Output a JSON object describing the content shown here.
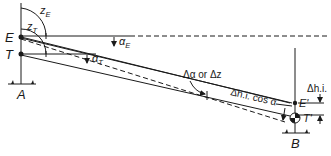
{
  "diagram": {
    "type": "trigonometric leveling geometry",
    "points": {
      "E": "E",
      "T": "T",
      "A": "A",
      "B": "B",
      "E_prime": "E'",
      "T_prime": "T'"
    },
    "angles": {
      "zE": "z",
      "zE_sub": "E",
      "zT": "z",
      "zT_sub": "T",
      "alphaE": "α",
      "alphaE_sub": "E",
      "alphaT": "α",
      "alphaT_sub": "T"
    },
    "annotations": {
      "delta_alpha": "Δα or Δz",
      "dhi_cos": "Δh.i. cos α",
      "dhi": "Δh.i."
    },
    "colors": {
      "line": "#1a1a1a",
      "background": "#ffffff"
    }
  }
}
